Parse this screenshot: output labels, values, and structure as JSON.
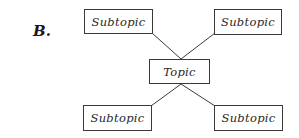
{
  "label": "B.",
  "topic": "Topic",
  "subtopics": [
    {
      "position": "top-left",
      "text": "Subtopic"
    },
    {
      "position": "top-right",
      "text": "Subtopic"
    },
    {
      "position": "bottom-left",
      "text": "Subtopic"
    },
    {
      "position": "bottom-right",
      "text": "Subtopic"
    }
  ],
  "colors": {
    "line": "#3a3a3a",
    "text": "#2a2a2a",
    "background": "#ffffff"
  }
}
